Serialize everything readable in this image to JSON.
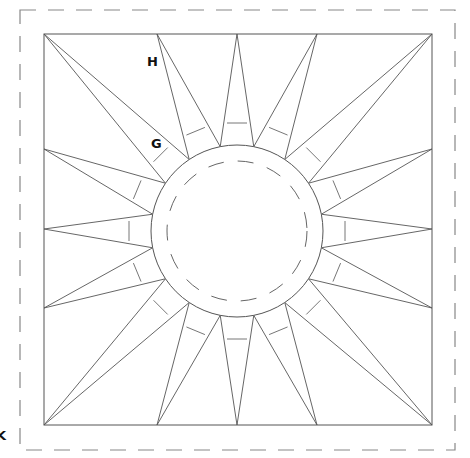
{
  "diagram": {
    "labels": [
      {
        "id": "H",
        "text": "H",
        "x": 147,
        "y": 66
      },
      {
        "id": "G",
        "text": "G",
        "x": 151,
        "y": 148
      },
      {
        "id": "K",
        "text": "K",
        "x": -4,
        "y": 440
      }
    ],
    "colors": {
      "line": "#555555",
      "dash": "#888888",
      "text": "#111111"
    },
    "outer_dashed_border": {
      "x": 20,
      "y": 10,
      "w": 435,
      "h": 440
    },
    "block_square": {
      "x": 44,
      "y": 34,
      "w": 388,
      "h": 391
    },
    "center_circle": {
      "cx": 237,
      "cy": 231,
      "r": 86
    },
    "inner_dashed_circle": {
      "r": 70
    },
    "spike_count": 16,
    "outer_points": [
      [
        44,
        34
      ],
      [
        157,
        34
      ],
      [
        237,
        34
      ],
      [
        317,
        34
      ],
      [
        432,
        34
      ],
      [
        432,
        149
      ],
      [
        432,
        229
      ],
      [
        432,
        308
      ],
      [
        432,
        425
      ],
      [
        317,
        425
      ],
      [
        237,
        425
      ],
      [
        157,
        425
      ],
      [
        44,
        425
      ],
      [
        44,
        308
      ],
      [
        44,
        229
      ],
      [
        44,
        149
      ]
    ]
  }
}
